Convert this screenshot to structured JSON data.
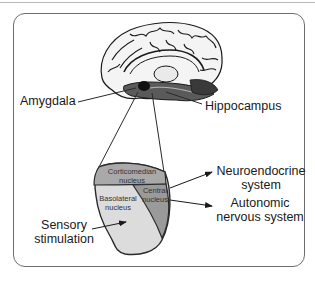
{
  "figure": {
    "structures": {
      "amygdala": "Amygdala",
      "hippocampus": "Hippocampus"
    },
    "nuclei": {
      "corticomedian": [
        "Corticomedian",
        "nucleus"
      ],
      "central": [
        "Central",
        "nucleus"
      ],
      "basolateral": [
        "Basolateral",
        "nucleus"
      ]
    },
    "inputs": {
      "sensory": [
        "Sensory",
        "stimulation"
      ]
    },
    "outputs": {
      "neuroendocrine": [
        "Neuroendocrine",
        "system"
      ],
      "autonomic": [
        "Autonomic",
        "nervous system"
      ]
    },
    "colors": {
      "frame": "#6d6d6d",
      "corticomedian_fill": "#a9a9a9",
      "central_fill": "#9a9a9a",
      "basolateral_fill": "#dcdcdc",
      "outline": "#2a2a2a",
      "amygdala_highlight": "#111111"
    }
  }
}
